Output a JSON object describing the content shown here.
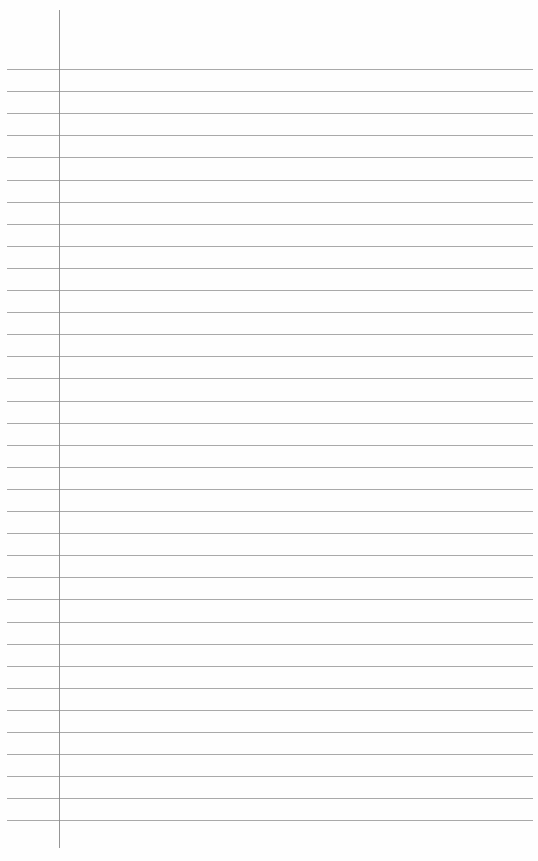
{
  "page": {
    "type": "lined-notebook-paper",
    "line_count": 35,
    "first_line_y": 69,
    "line_spacing": 22.1,
    "line_color": "#9a9a9a",
    "margin_line_color": "#8a8a8a",
    "background": "#fefefe",
    "text_content": []
  }
}
